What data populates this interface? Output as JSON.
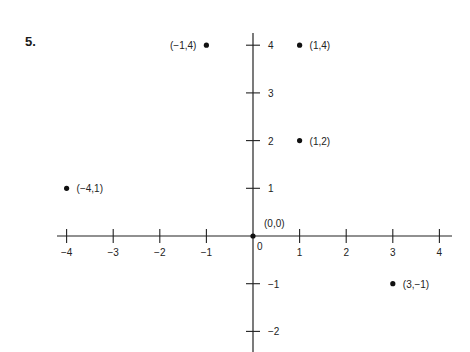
{
  "problem": {
    "number": "5."
  },
  "chart_data": {
    "type": "scatter",
    "title": "",
    "xlabel": "",
    "ylabel": "",
    "xlim": [
      -4,
      4
    ],
    "ylim": [
      -2,
      4
    ],
    "grid": false,
    "x_ticks": [
      -4,
      -3,
      -2,
      -1,
      1,
      2,
      3,
      4
    ],
    "x_tick_labels": [
      "−4",
      "−3",
      "−2",
      "−1",
      "1",
      "2",
      "3",
      "4"
    ],
    "y_ticks": [
      4,
      3,
      2,
      1,
      -1,
      -2
    ],
    "y_tick_labels": [
      "4",
      "3",
      "2",
      "1",
      "−1",
      "−2"
    ],
    "origin_label": "0",
    "points": [
      {
        "x": -1,
        "y": 4,
        "label": "(−1,4)",
        "label_side": "left"
      },
      {
        "x": 1,
        "y": 4,
        "label": "(1,4)",
        "label_side": "right"
      },
      {
        "x": 1,
        "y": 2,
        "label": "(1,2)",
        "label_side": "right"
      },
      {
        "x": -4,
        "y": 1,
        "label": "(−4,1)",
        "label_side": "right"
      },
      {
        "x": 0,
        "y": 0,
        "label": "(0,0)",
        "label_side": "above-right"
      },
      {
        "x": 3,
        "y": -1,
        "label": "(3,−1)",
        "label_side": "right"
      }
    ]
  }
}
